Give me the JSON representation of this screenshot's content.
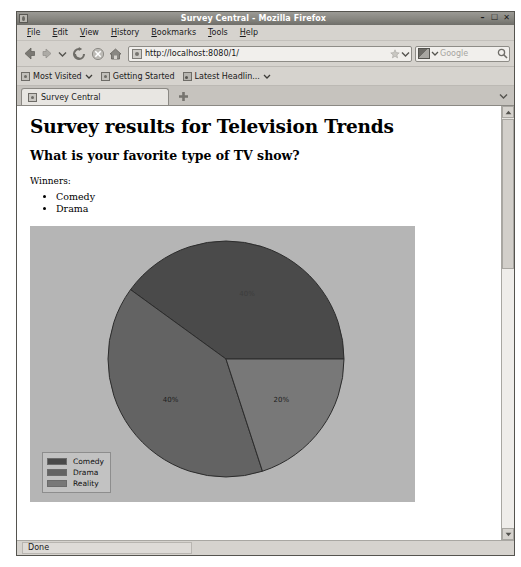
{
  "window": {
    "title": "Survey Central - Mozilla Firefox",
    "minimize_label": "–",
    "maximize_label": "☐",
    "close_label": "✕"
  },
  "menu": {
    "items": [
      {
        "label": "File",
        "accel": "F",
        "rest": "ile"
      },
      {
        "label": "Edit",
        "accel": "E",
        "rest": "dit"
      },
      {
        "label": "View",
        "accel": "V",
        "rest": "iew"
      },
      {
        "label": "History",
        "accel": "H",
        "rest": "istory"
      },
      {
        "label": "Bookmarks",
        "accel": "B",
        "rest": "ookmarks"
      },
      {
        "label": "Tools",
        "accel": "T",
        "rest": "ools"
      },
      {
        "label": "Help",
        "accel": "H",
        "rest": "elp"
      }
    ]
  },
  "toolbar": {
    "back_icon": "back-arrow-icon",
    "forward_icon": "forward-arrow-icon",
    "history_dropdown_icon": "chevron-down-icon",
    "reload_icon": "reload-icon",
    "stop_icon": "stop-icon",
    "home_icon": "home-icon",
    "url": "http://localhost:8080/1/",
    "url_star_icon": "bookmark-star-icon",
    "url_dropdown_icon": "chevron-down-icon",
    "search_placeholder": "Google",
    "search_engine_icon": "search-engine-icon",
    "search_go_icon": "search-icon"
  },
  "bookmarks": {
    "items": [
      {
        "label": "Most Visited",
        "icon": "globe-icon",
        "has_chevron": true
      },
      {
        "label": "Getting Started",
        "icon": "globe-icon",
        "has_chevron": false
      },
      {
        "label": "Latest Headlin...",
        "icon": "feed-icon",
        "has_chevron": true
      }
    ]
  },
  "tabs": {
    "active": {
      "label": "Survey Central",
      "favicon": "page-favicon"
    },
    "new_tab_label": "+",
    "tab_list_icon": "chevron-down-icon"
  },
  "page": {
    "title": "Survey results for Television Trends",
    "subtitle": "What is your favorite type of TV show?",
    "winners_label": "Winners:",
    "winners": [
      "Comedy",
      "Drama"
    ]
  },
  "chart_data": {
    "type": "pie",
    "title": "",
    "categories": [
      "Comedy",
      "Drama",
      "Reality"
    ],
    "values": [
      40,
      40,
      20
    ],
    "labels": [
      "40%",
      "40%",
      "20%"
    ],
    "colors": [
      "#4a4a4a",
      "#636363",
      "#787878"
    ],
    "background": "#b5b5b5",
    "legend_position": "bottom-left",
    "legend": [
      {
        "label": "Comedy",
        "color": "#4a4a4a"
      },
      {
        "label": "Drama",
        "color": "#636363"
      },
      {
        "label": "Reality",
        "color": "#787878"
      }
    ]
  },
  "scrollbar": {
    "up_arrow": "▲",
    "down_arrow": "▼"
  },
  "status": {
    "text": "Done"
  }
}
